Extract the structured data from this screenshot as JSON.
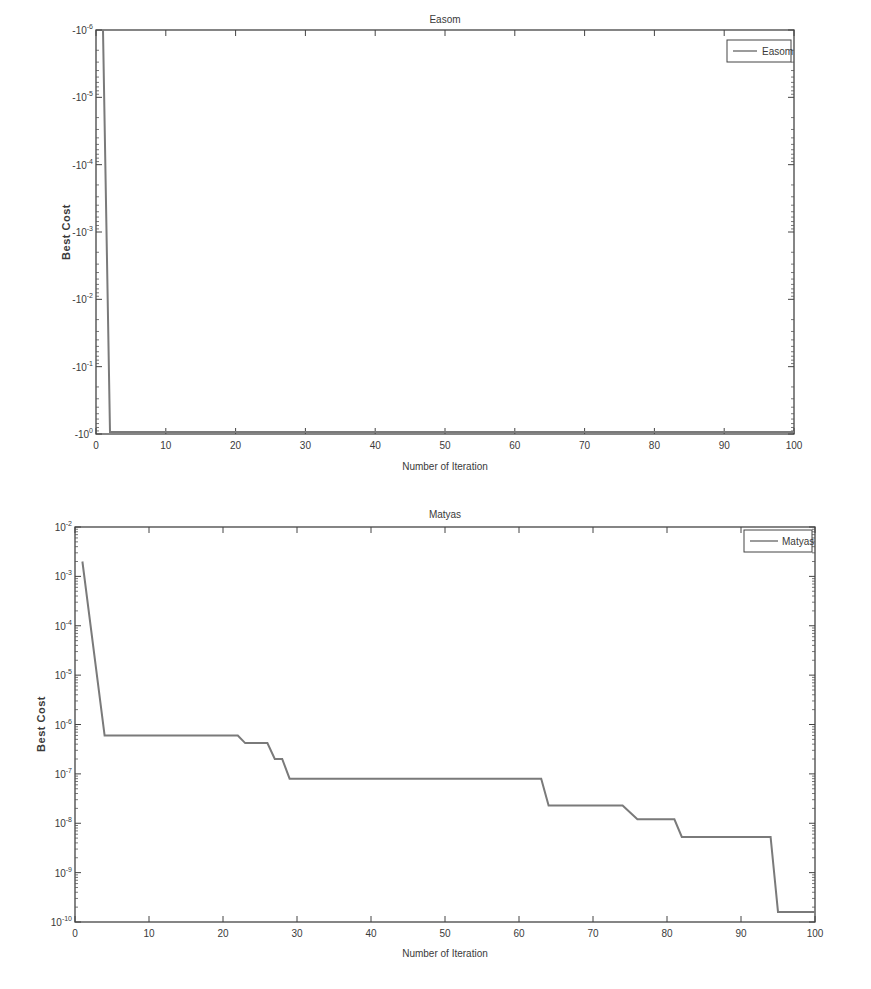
{
  "chart_data": [
    {
      "type": "line",
      "title": "Easom",
      "xlabel": "Number of Iteration",
      "ylabel": "Best Cost",
      "yscale": "log (negative values)",
      "xlim": [
        0,
        100
      ],
      "ylim": [
        -1,
        -1e-06
      ],
      "x_ticks": [
        0,
        10,
        20,
        30,
        40,
        50,
        60,
        70,
        80,
        90,
        100
      ],
      "y_ticks": [
        "-10^-6",
        "-10^-5",
        "-10^-4",
        "-10^-3",
        "-10^-2",
        "-10^-1",
        "-10^0"
      ],
      "legend": {
        "position": "top-right",
        "entries": [
          "Easom"
        ]
      },
      "grid": false,
      "series": [
        {
          "name": "Easom",
          "color": "#7a7a7a",
          "x": [
            1,
            2,
            3,
            100
          ],
          "y": [
            -1e-06,
            -0.95,
            -1.0,
            -1.0
          ]
        }
      ]
    },
    {
      "type": "line",
      "title": "Matyas",
      "xlabel": "Number of Iteration",
      "ylabel": "Best Cost",
      "yscale": "log",
      "xlim": [
        0,
        100
      ],
      "ylim": [
        1e-10,
        0.01
      ],
      "x_ticks": [
        0,
        10,
        20,
        30,
        40,
        50,
        60,
        70,
        80,
        90,
        100
      ],
      "y_ticks": [
        "10^-2",
        "10^-3",
        "10^-4",
        "10^-5",
        "10^-6",
        "10^-7",
        "10^-8",
        "10^-9",
        "10^-10"
      ],
      "legend": {
        "position": "top-right",
        "entries": [
          "Matyas"
        ]
      },
      "grid": false,
      "series": [
        {
          "name": "Matyas",
          "color": "#7a7a7a",
          "x": [
            1,
            4,
            22,
            23,
            26,
            27,
            28,
            29,
            63,
            64,
            74,
            76,
            81,
            82,
            94,
            95,
            100
          ],
          "y": [
            0.002,
            6e-07,
            6e-07,
            4.2e-07,
            4.2e-07,
            2e-07,
            2e-07,
            8e-08,
            8e-08,
            2.3e-08,
            2.3e-08,
            1.2e-08,
            1.2e-08,
            5.3e-09,
            5.3e-09,
            1.6e-10,
            1.6e-10
          ]
        }
      ]
    }
  ],
  "charts": {
    "top": {
      "title": "Easom",
      "xlabel": "Number of Iteration",
      "ylabel": "Best Cost",
      "legend": "Easom",
      "x_ticks": [
        "0",
        "10",
        "20",
        "30",
        "40",
        "50",
        "60",
        "70",
        "80",
        "90",
        "100"
      ],
      "y_ticks": [
        {
          "base": "-10",
          "exp": "-6"
        },
        {
          "base": "-10",
          "exp": "-5"
        },
        {
          "base": "-10",
          "exp": "-4"
        },
        {
          "base": "-10",
          "exp": "-3"
        },
        {
          "base": "-10",
          "exp": "-2"
        },
        {
          "base": "-10",
          "exp": "-1"
        },
        {
          "base": "-10",
          "exp": "0"
        }
      ]
    },
    "bottom": {
      "title": "Matyas",
      "xlabel": "Number of Iteration",
      "ylabel": "Best Cost",
      "legend": "Matyas",
      "x_ticks": [
        "0",
        "10",
        "20",
        "30",
        "40",
        "50",
        "60",
        "70",
        "80",
        "90",
        "100"
      ],
      "y_ticks": [
        {
          "base": "10",
          "exp": "-2"
        },
        {
          "base": "10",
          "exp": "-3"
        },
        {
          "base": "10",
          "exp": "-4"
        },
        {
          "base": "10",
          "exp": "-5"
        },
        {
          "base": "10",
          "exp": "-6"
        },
        {
          "base": "10",
          "exp": "-7"
        },
        {
          "base": "10",
          "exp": "-8"
        },
        {
          "base": "10",
          "exp": "-9"
        },
        {
          "base": "10",
          "exp": "-10"
        }
      ]
    }
  },
  "colors": {
    "axis": "#444444",
    "line": "#7a7a7a",
    "text": "#3a3a3a"
  }
}
